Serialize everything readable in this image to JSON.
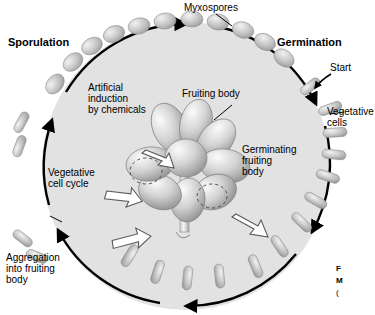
{
  "figure": {
    "type": "life-cycle-diagram",
    "organism_cycle": "Myxococcus developmental cycle",
    "background_color": "#e3e3e3",
    "circle_fill": "#e0e0e0",
    "arrow_color": "#000000",
    "cell_color": "#b9b9b9"
  },
  "labels": {
    "sporulation": "Sporulation",
    "germination": "Germination",
    "myxospores": "Myxospores",
    "start": "Start",
    "vegetative_cells": "Vegetative\ncells",
    "fruiting_body": "Fruiting body",
    "germinating_fruiting_body": "Germinating\nfruiting\nbody",
    "artificial_induction": "Artificial\ninduction\nby chemicals",
    "vegetative_cell_cycle": "Vegetative\ncell cycle",
    "aggregation": "Aggregation\ninto fruiting\nbody"
  },
  "caption": {
    "line1": "F",
    "line2": "M",
    "line3": "("
  }
}
